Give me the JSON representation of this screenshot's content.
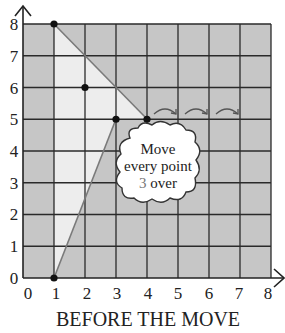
{
  "diagram": {
    "caption": "BEFORE THE MOVE",
    "x_ticks": [
      "0",
      "1",
      "2",
      "3",
      "4",
      "5",
      "6",
      "7",
      "8"
    ],
    "y_ticks": [
      "0",
      "1",
      "2",
      "3",
      "4",
      "5",
      "6",
      "7",
      "8"
    ],
    "points": [
      {
        "x": 1,
        "y": 8
      },
      {
        "x": 2,
        "y": 6
      },
      {
        "x": 3,
        "y": 5
      },
      {
        "x": 4,
        "y": 5
      },
      {
        "x": 1,
        "y": 0
      }
    ],
    "shape_vertices": [
      [
        1,
        8
      ],
      [
        4,
        5
      ],
      [
        3,
        5
      ],
      [
        1,
        0
      ]
    ],
    "cloud": {
      "line1": "Move",
      "line2": "every point",
      "line3_number": "3",
      "line3_rest": " over"
    },
    "move_arrows_count": 3,
    "colors": {
      "grid_bg": "#c6c6c6",
      "shape_fill": "#ededed",
      "grid_line": "#2a2a2a",
      "shape_edge": "#7a7a7a",
      "highlight_number": "#777777"
    }
  }
}
